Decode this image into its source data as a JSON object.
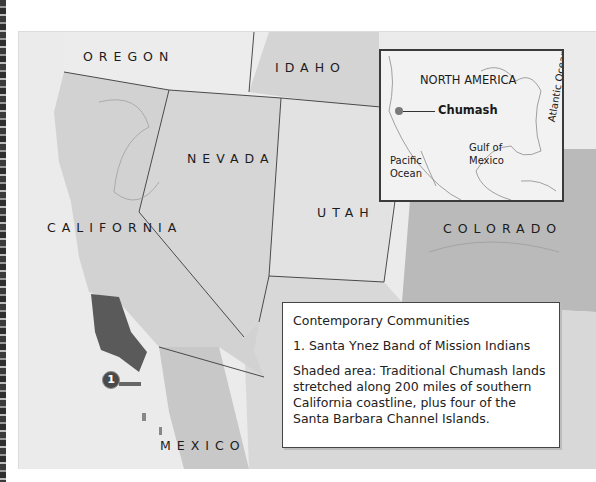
{
  "map": {
    "states": [
      {
        "name": "OREGON"
      },
      {
        "name": "IDAHO"
      },
      {
        "name": "NEVADA"
      },
      {
        "name": "UTAH"
      },
      {
        "name": "CALIFORNIA"
      },
      {
        "name": "COLORADO"
      },
      {
        "name": "MEXICO"
      }
    ],
    "marker": {
      "number": "1"
    },
    "colors": {
      "ocean": "#ebebeb",
      "land_light": "#e4e4e4",
      "land_mid": "#d2d2d2",
      "colorado": "#b9b9b9",
      "chumash_shaded": "#5a5a5a",
      "border": "#4a4a4a"
    }
  },
  "inset": {
    "title": "NORTH AMERICA",
    "point_label": "Chumash",
    "pacific": "Pacific Ocean",
    "pacific_line1": "Pacific",
    "pacific_line2": "Ocean",
    "gulf_line1": "Gulf of",
    "gulf_line2": "Mexico",
    "atlantic": "Atlantic Ocean"
  },
  "legend": {
    "heading": "Contemporary Communities",
    "items": [
      {
        "label": "1. Santa Ynez Band of Mission Indians"
      }
    ],
    "note": "Shaded area: Traditional Chumash lands stretched along 200 miles of southern California coastline, plus four of the Santa Barbara Channel Islands."
  }
}
